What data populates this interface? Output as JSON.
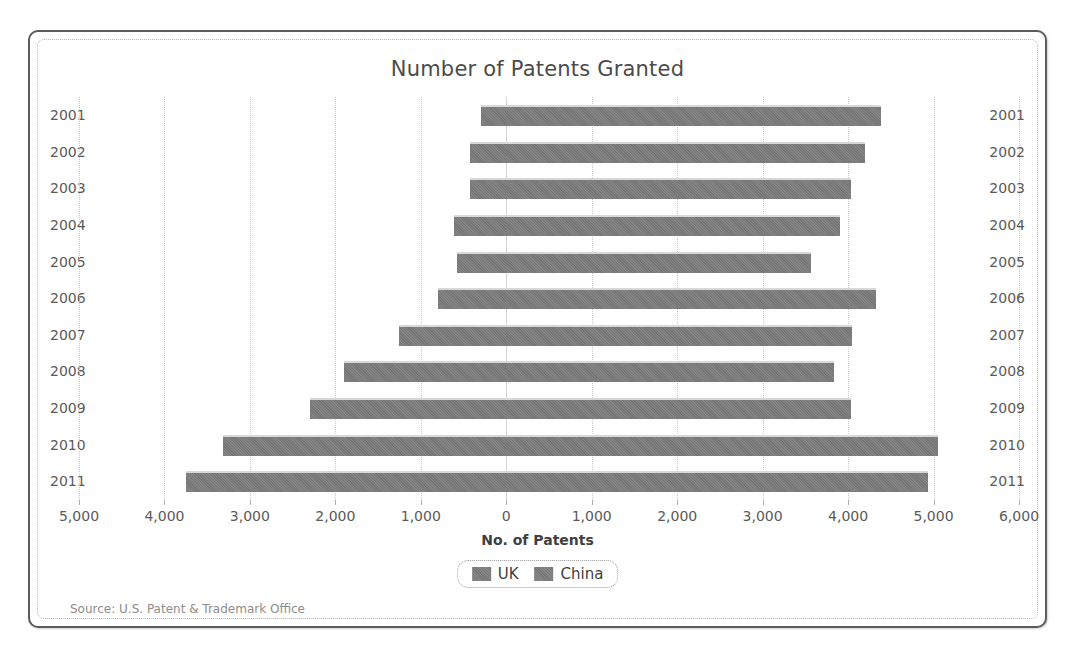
{
  "chart_data": {
    "type": "bar",
    "orientation": "horizontal",
    "subtype": "bidirectional-pyramid",
    "title": "Number of Patents Granted",
    "xlabel": "No. of Patents",
    "ylabel": "",
    "xlim": [
      -5000,
      6000
    ],
    "xticks": [
      -5000,
      -4000,
      -3000,
      -2000,
      -1000,
      0,
      1000,
      2000,
      3000,
      4000,
      5000,
      6000
    ],
    "xticklabels": [
      "5,000",
      "4,000",
      "3,000",
      "2,000",
      "1,000",
      "0",
      "1,000",
      "2,000",
      "3,000",
      "4,000",
      "5,000",
      "6,000"
    ],
    "grid": true,
    "legend_position": "bottom",
    "categories": [
      "2001",
      "2002",
      "2003",
      "2004",
      "2005",
      "2006",
      "2007",
      "2008",
      "2009",
      "2010",
      "2011"
    ],
    "series": [
      {
        "name": "UK",
        "direction": "right",
        "color": "#767676",
        "values": [
          4380,
          4200,
          4030,
          3910,
          3570,
          4330,
          4040,
          3840,
          4030,
          5050,
          4930
        ]
      },
      {
        "name": "China",
        "direction": "left",
        "color": "#767676",
        "values": [
          300,
          420,
          420,
          610,
          580,
          800,
          1250,
          1900,
          2300,
          3320,
          3750
        ]
      }
    ],
    "source": "Source: U.S. Patent & Trademark Office"
  },
  "legend": {
    "items": [
      {
        "label": "UK"
      },
      {
        "label": "China"
      }
    ]
  },
  "colors": {
    "bar": "#767676",
    "grid": "#c9c9c9",
    "frame": "#5c5c5c",
    "text": "#5a5a5a"
  }
}
